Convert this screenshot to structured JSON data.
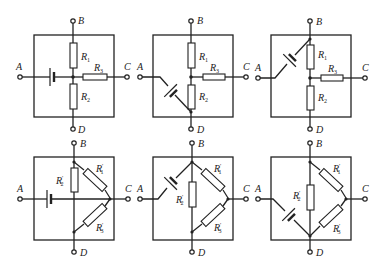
{
  "figure": {
    "type": "circuit-diagrams",
    "panels": [
      {
        "id": "top-left",
        "terminals": {
          "A": "A",
          "B": "B",
          "C": "C",
          "D": "D"
        },
        "resistors": [
          {
            "name": "R",
            "sub": "1",
            "prime": ""
          },
          {
            "name": "R",
            "sub": "3",
            "prime": ""
          },
          {
            "name": "R",
            "sub": "2",
            "prime": ""
          }
        ],
        "topology": "star",
        "battery": "A-to-center horizontal"
      },
      {
        "id": "top-middle",
        "terminals": {
          "A": "A",
          "B": "B",
          "C": "C",
          "D": "D"
        },
        "resistors": [
          {
            "name": "R",
            "sub": "1",
            "prime": ""
          },
          {
            "name": "R",
            "sub": "3",
            "prime": ""
          },
          {
            "name": "R",
            "sub": "2",
            "prime": ""
          }
        ],
        "topology": "star",
        "battery": "A-to-D diagonal"
      },
      {
        "id": "top-right",
        "terminals": {
          "A": "A",
          "B": "B",
          "C": "C",
          "D": "D"
        },
        "resistors": [
          {
            "name": "R",
            "sub": "1",
            "prime": ""
          },
          {
            "name": "R",
            "sub": "3",
            "prime": ""
          },
          {
            "name": "R",
            "sub": "2",
            "prime": ""
          }
        ],
        "topology": "star",
        "battery": "A-to-B diagonal"
      },
      {
        "id": "bottom-left",
        "terminals": {
          "A": "A",
          "B": "B",
          "C": "C",
          "D": "D"
        },
        "resistors": [
          {
            "name": "R",
            "sub": "2",
            "prime": "′"
          },
          {
            "name": "R",
            "sub": "1",
            "prime": "′"
          },
          {
            "name": "R",
            "sub": "3",
            "prime": "′"
          }
        ],
        "topology": "delta",
        "battery": "A-to-C horizontal"
      },
      {
        "id": "bottom-middle",
        "terminals": {
          "A": "A",
          "B": "B",
          "C": "C",
          "D": "D"
        },
        "resistors": [
          {
            "name": "R",
            "sub": "2",
            "prime": "′"
          },
          {
            "name": "R",
            "sub": "1",
            "prime": "′"
          },
          {
            "name": "R",
            "sub": "3",
            "prime": "′"
          }
        ],
        "topology": "delta",
        "battery": "A-to-B diagonal"
      },
      {
        "id": "bottom-right",
        "terminals": {
          "A": "A",
          "B": "B",
          "C": "C",
          "D": "D"
        },
        "resistors": [
          {
            "name": "R",
            "sub": "2",
            "prime": "′"
          },
          {
            "name": "R",
            "sub": "1",
            "prime": "′"
          },
          {
            "name": "R",
            "sub": "3",
            "prime": "′"
          }
        ],
        "topology": "delta",
        "battery": "A-to-D diagonal"
      }
    ]
  },
  "labels": {
    "A": "A",
    "B": "B",
    "C": "C",
    "D": "D",
    "R": "R",
    "s1": "1",
    "s2": "2",
    "s3": "3",
    "p": "′"
  }
}
